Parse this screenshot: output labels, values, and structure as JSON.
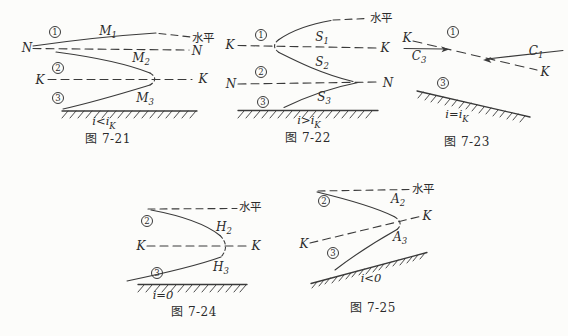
{
  "page": {
    "background": "#fcfcfa",
    "ink": "#3a3a3a"
  },
  "f21": {
    "zone1": "1",
    "zone2": "2",
    "zone3": "3",
    "m1_main": "M",
    "m1_sub": "1",
    "m2_main": "M",
    "m2_sub": "2",
    "m3_main": "M",
    "m3_sub": "3",
    "horizontal": "水平",
    "n_left": "N",
    "n_right": "N",
    "k_left": "K",
    "k_right": "K",
    "cond_main": "i<i",
    "cond_sub": "K",
    "caption": "图 7-21"
  },
  "f22": {
    "zone1": "1",
    "zone2": "2",
    "zone3": "3",
    "s1_main": "S",
    "s1_sub": "1",
    "s2_main": "S",
    "s2_sub": "2",
    "s3_main": "S",
    "s3_sub": "3",
    "horizontal": "水平",
    "k_left": "K",
    "k_right": "K",
    "n_left": "N",
    "n_right": "N",
    "cond_main": "i>i",
    "cond_sub": "K",
    "caption": "图 7-22"
  },
  "f23": {
    "zone1": "1",
    "zone3": "3",
    "c3_main": "C",
    "c3_sub": "3",
    "c1_main": "C",
    "c1_sub": "1",
    "k_top_left": "K",
    "k_bottom_right": "K",
    "cond_main": "i=i",
    "cond_sub": "K",
    "caption": "图 7-23"
  },
  "f24": {
    "zone2": "2",
    "zone3": "3",
    "h2_main": "H",
    "h2_sub": "2",
    "h3_main": "H",
    "h3_sub": "3",
    "horizontal": "水平",
    "k_left": "K",
    "k_right": "K",
    "cond_main": "i=0",
    "cond_sub": "",
    "caption": "图 7-24"
  },
  "f25": {
    "zone2": "2",
    "zone3": "3",
    "a2_main": "A",
    "a2_sub": "2",
    "a3_main": "A",
    "a3_sub": "3",
    "horizontal": "水平",
    "k_left": "K",
    "k_right": "K",
    "cond_main": "i<0",
    "cond_sub": "",
    "caption": "图 7-25"
  }
}
